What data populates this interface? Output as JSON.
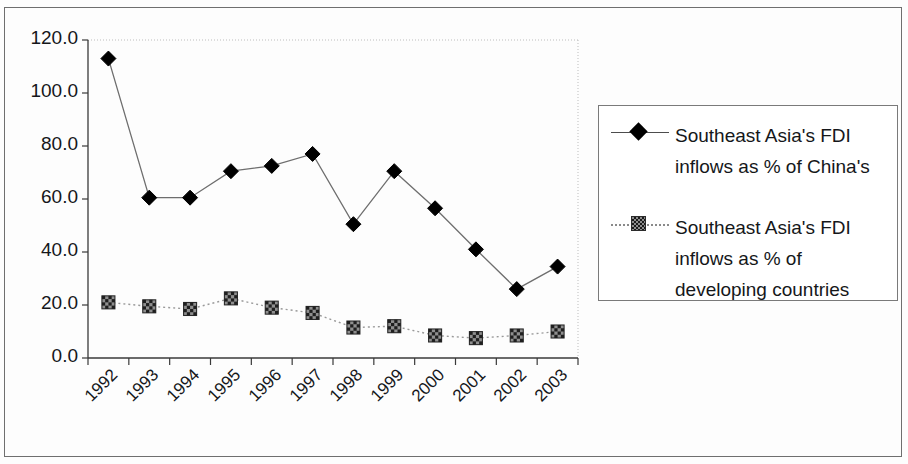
{
  "chart_data": {
    "type": "line",
    "title": "",
    "xlabel": "",
    "ylabel": "",
    "categories": [
      "1992",
      "1993",
      "1994",
      "1995",
      "1996",
      "1997",
      "1998",
      "1999",
      "2000",
      "2001",
      "2002",
      "2003"
    ],
    "ylim": [
      0,
      120
    ],
    "ytick_values": [
      0,
      20,
      40,
      60,
      80,
      100,
      120
    ],
    "ytick_labels": [
      "0.0",
      "20.0",
      "40.0",
      "60.0",
      "80.0",
      "100.0",
      "120.0"
    ],
    "grid": false,
    "legend_position": "right",
    "series": [
      {
        "name": "Southeast Asia's FDI inflows as % of China's",
        "name_lines": [
          "Southeast Asia's FDI",
          "inflows as % of China's"
        ],
        "marker": "diamond",
        "marker_color": "#000000",
        "line_color": "#6e6e6e",
        "line_style": "solid",
        "values": [
          113.0,
          60.5,
          60.5,
          70.5,
          72.5,
          77.0,
          50.5,
          70.5,
          56.5,
          41.0,
          26.0,
          34.5
        ]
      },
      {
        "name": "Southeast Asia's FDI inflows as % of developing countries",
        "name_lines": [
          "Southeast Asia's FDI",
          "inflows as % of",
          "developing countries"
        ],
        "marker": "square",
        "marker_color": "#3d3d3d",
        "line_color": "#9a9a9a",
        "line_style": "dotted",
        "values": [
          21.0,
          19.5,
          18.5,
          22.5,
          19.0,
          17.0,
          11.5,
          12.0,
          8.5,
          7.5,
          8.5,
          10.0
        ]
      }
    ]
  },
  "colors": {
    "frame": "#6f6f6f",
    "axis": "#3a3a3a",
    "plot_border_faint": "#bdbdbd",
    "text": "#15171a",
    "background": "#fdfdfd"
  }
}
